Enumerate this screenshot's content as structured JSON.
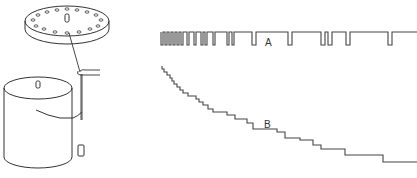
{
  "figure": {
    "colors": {
      "ink": "#333333",
      "background": "#ffffff"
    },
    "apparatus": {
      "disc": {
        "hole_count": 18
      },
      "parts": [
        "perforated-disc",
        "spindle",
        "string",
        "guide-hook",
        "drum",
        "weight"
      ]
    },
    "traces": [
      {
        "id": "A",
        "label": "A",
        "type": "pulse-train",
        "description": "pulses with increasing spacing"
      },
      {
        "id": "B",
        "label": "B",
        "type": "staircase",
        "description": "descending staircase with lengthening steps"
      }
    ]
  }
}
